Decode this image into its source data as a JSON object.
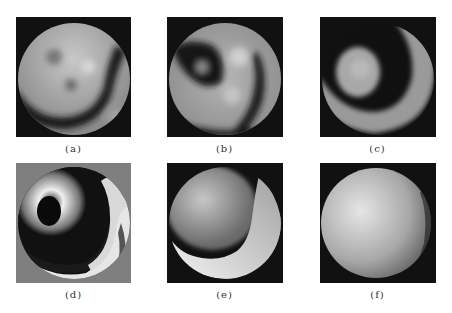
{
  "figure": {
    "panels": [
      {
        "id": "a",
        "caption": "(a)",
        "description": "wrapped phase map, gray disk with dark arc band",
        "background": "#111111"
      },
      {
        "id": "b",
        "caption": "(b)",
        "description": "wrapped phase map, gray disk with dark blobs and band",
        "background": "#111111"
      },
      {
        "id": "c",
        "caption": "(c)",
        "description": "wrapped phase map, bright central blob ringed by dark band and bright arc",
        "background": "#111111"
      },
      {
        "id": "d",
        "caption": "(d)",
        "description": "wrapped phase fringes, concentric bright/dark rings on gray background",
        "background": "#7f7f7f"
      },
      {
        "id": "e",
        "caption": "(e)",
        "description": "partially unwrapped phase, bright crescent with dark boundary",
        "background": "#111111"
      },
      {
        "id": "f",
        "caption": "(f)",
        "description": "unwrapped phase, smooth bright disk",
        "background": "#111111"
      }
    ]
  }
}
